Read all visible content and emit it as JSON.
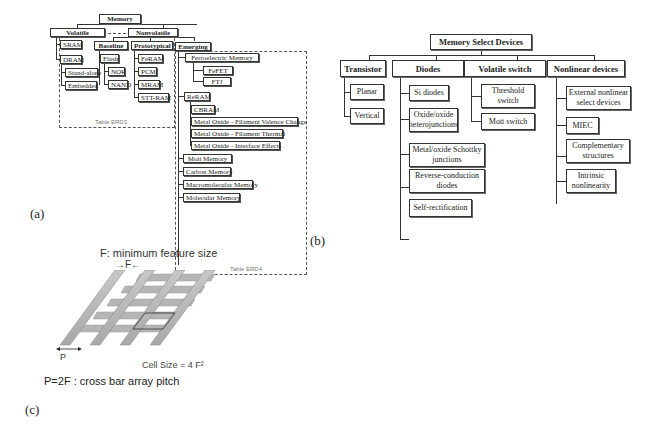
{
  "panel_a": {
    "label": "(a)",
    "root": "Memory",
    "volatile": {
      "label": "Volatile",
      "items": [
        "SRAM",
        "DRAM"
      ],
      "dram_children": [
        "Stand-alone",
        "Embedded"
      ]
    },
    "nonvolatile": {
      "label": "Nonvolatile",
      "baseline": {
        "label": "Baseline",
        "items": [
          "Flash",
          "NOR",
          "NAND"
        ]
      },
      "prototypical": {
        "label": "Prototypical",
        "items": [
          "FeRAM",
          "PCM",
          "MRAM",
          "STT-RAM"
        ]
      },
      "emerging": {
        "label": "Emerging",
        "ferroelectric": {
          "label": "Ferroelectric Memory",
          "items": [
            "FeFET",
            "FTJ"
          ]
        },
        "reram": {
          "label": "ReRAM",
          "items": [
            "CBRAM",
            "Metal Oxide - Filament Valence Change",
            "Metal Oxide - Filament Thermal",
            "Metal Oxide - Interface Effects"
          ]
        },
        "others": [
          "Mott Memory",
          "Carbon Memory",
          "Macromolecular Memory",
          "Molecular Memory"
        ]
      }
    },
    "table_erd3": "Table ERD3",
    "table_erd4": "Table ERD4"
  },
  "panel_b": {
    "label": "(b)",
    "root": "Memory Select Devices",
    "categories": [
      {
        "label": "Transistor",
        "items": [
          "Planar",
          "Vertical"
        ]
      },
      {
        "label": "Diodes",
        "items": [
          "Si diodes",
          "Oxide/oxide heterojunctions",
          "Metal/oxide Schottky junctions",
          "Reverse-conduction diodes",
          "Self-rectification"
        ]
      },
      {
        "label": "Volatile switch",
        "items": [
          "Threshold switch",
          "Mott switch"
        ]
      },
      {
        "label": "Nonlinear devices",
        "items": [
          "External nonlinear select devices",
          "MIEC",
          "Complementary structures",
          "Intrinsic nonlinearity"
        ]
      }
    ]
  },
  "panel_c": {
    "label": "(c)",
    "title": "F: minimum feature size",
    "f_marker": "F",
    "p_marker": "P",
    "cell_size": "Cell Size = 4 F²",
    "pitch_caption": "P=2F : cross bar array pitch"
  }
}
